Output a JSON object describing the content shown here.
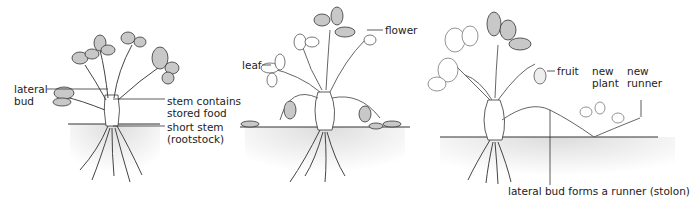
{
  "diagram": {
    "panels": [
      {
        "id": "panel-1",
        "labels": {
          "lateral_bud": "lateral\nbud",
          "stem_contains": "stem contains\nstored food",
          "short_stem": "short stem\n(rootstock)"
        }
      },
      {
        "id": "panel-2",
        "labels": {
          "leaf": "leaf",
          "flower": "flower"
        }
      },
      {
        "id": "panel-3",
        "labels": {
          "fruit": "fruit",
          "new_plant": "new\nplant",
          "new_runner": "new\nrunner",
          "runner": "lateral bud forms a runner (stolon)"
        }
      }
    ],
    "colors": {
      "leaf_fill": "#c8c8c8",
      "line": "#333333",
      "soil": "#e6e6e6"
    }
  }
}
